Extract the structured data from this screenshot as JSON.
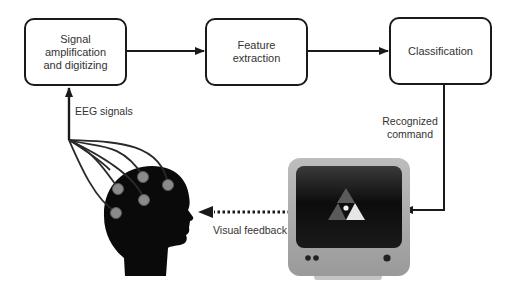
{
  "diagram": {
    "boxes": [
      {
        "id": "signal",
        "label": "Signal\namplification\nand digitizing"
      },
      {
        "id": "feature",
        "label": "Feature\nextraction"
      },
      {
        "id": "classification",
        "label": "Classification"
      }
    ],
    "labels": {
      "eeg": "EEG signals",
      "recognized": "Recognized\ncommand",
      "feedback": "Visual feedback"
    },
    "edges": [
      {
        "from": "signal",
        "to": "feature",
        "style": "solid"
      },
      {
        "from": "feature",
        "to": "classification",
        "style": "solid"
      },
      {
        "from": "classification",
        "to": "monitor",
        "style": "solid",
        "label": "Recognized command"
      },
      {
        "from": "monitor",
        "to": "head",
        "style": "dotted",
        "label": "Visual feedback"
      },
      {
        "from": "head",
        "to": "signal",
        "style": "solid",
        "label": "EEG signals"
      }
    ],
    "icons": {
      "head": "human-head-with-electrodes",
      "monitor": "crt-monitor-with-triangle-logo"
    },
    "colors": {
      "line": "#1a1a1a",
      "text": "#333333",
      "monitor_body": "#a8a8a8",
      "screen": "#111111",
      "electrode": "#8a8a8a"
    }
  }
}
